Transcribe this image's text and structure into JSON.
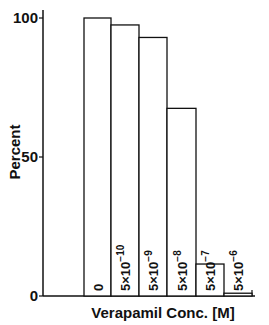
{
  "chart_data": {
    "type": "bar",
    "title": "",
    "xlabel": "Verapamil Conc. [M]",
    "ylabel": "Percent",
    "ylim": [
      0,
      100
    ],
    "yticks": [
      0,
      50,
      100
    ],
    "grid": false,
    "legend": null,
    "categories": [
      "0",
      "5×10⁻¹⁰",
      "5×10⁻⁹",
      "5×10⁻⁸",
      "5×10⁻⁷",
      "5×10⁻⁶"
    ],
    "category_parts": [
      {
        "base": "0",
        "exp": ""
      },
      {
        "base": "5×10",
        "exp": "−10"
      },
      {
        "base": "5×10",
        "exp": "−9"
      },
      {
        "base": "5×10",
        "exp": "−8"
      },
      {
        "base": "5×10",
        "exp": "−7"
      },
      {
        "base": "5×10",
        "exp": "−6"
      }
    ],
    "values": [
      100,
      97.5,
      93,
      67.5,
      11.5,
      1
    ]
  },
  "labels": {
    "ylabel": "Percent",
    "xlabel": "Verapamil Conc. [M]",
    "ytick_0": "0",
    "ytick_50": "50",
    "ytick_100": "100"
  }
}
